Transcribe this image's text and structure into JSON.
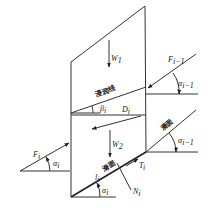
{
  "diagram": {
    "type": "free-body force diagram of a soil slice on a slope",
    "labels": {
      "w1": {
        "main": "W",
        "sub": "1"
      },
      "w2": {
        "main": "W",
        "sub": "2"
      },
      "wetting_line": "浸润线",
      "beta": {
        "main": "β",
        "sub": "i"
      },
      "d": {
        "main": "D",
        "sub": "i"
      },
      "f_prev": {
        "main": "F",
        "sub": "i−1"
      },
      "alpha_prev_top": {
        "main": "α",
        "sub": "i−1"
      },
      "slip_surface_right": "滑面",
      "alpha_prev_right": {
        "main": "α",
        "sub": "i−1"
      },
      "f_i": {
        "main": "F",
        "sub": "i"
      },
      "alpha_left": {
        "main": "α",
        "sub": "i"
      },
      "l": {
        "main": "l",
        "sub": "i"
      },
      "slip_surface_bottom": "滑面",
      "t": {
        "main": "T",
        "sub": "i"
      },
      "alpha_bottom": {
        "main": "α",
        "sub": "i"
      },
      "n": {
        "main": "N",
        "sub": "i"
      }
    },
    "colors": {
      "line": "#333333",
      "background": "#ffffff"
    }
  }
}
